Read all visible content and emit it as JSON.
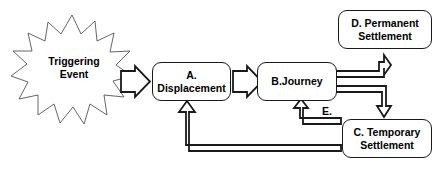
{
  "diagram": {
    "background_color": "#ffffff",
    "stroke_color": "#1a1a1a",
    "burst_stroke_color": "#555555",
    "nodes": {
      "trigger": {
        "name": "trigger-event-burst",
        "label": "Triggering\nEvent",
        "shape": "starburst"
      },
      "a": {
        "name": "box-a-displacement",
        "label": "A. Displacement",
        "shape": "rounded-rectangle"
      },
      "b": {
        "name": "box-b-journey",
        "label": "B.Journey",
        "shape": "rounded-rectangle"
      },
      "c": {
        "name": "box-c-temporary-settlement",
        "label": "C. Temporary\nSettlement",
        "shape": "rounded-rectangle"
      },
      "d": {
        "name": "box-d-permanent-settlement",
        "label": "D. Permanent\nSettlement",
        "shape": "rounded-rectangle"
      }
    },
    "edges": {
      "trigger_to_a": {
        "name": "arrow-trigger-to-a",
        "label": ""
      },
      "a_to_b": {
        "name": "arrow-a-to-b",
        "label": ""
      },
      "b_to_d": {
        "name": "arrow-b-to-d",
        "label": ""
      },
      "b_to_c": {
        "name": "arrow-b-to-c",
        "label": ""
      },
      "c_to_b": {
        "name": "arrow-c-to-b",
        "label": "E."
      },
      "c_to_a": {
        "name": "arrow-c-to-a",
        "label": ""
      }
    },
    "edge_label_e": "E."
  }
}
